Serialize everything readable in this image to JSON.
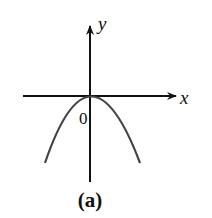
{
  "figure": {
    "caption": "(a)",
    "x_axis_label": "x",
    "y_axis_label": "y",
    "origin_label": "0",
    "curve": "downward-opening parabola with vertex at origin",
    "colors": {
      "axes": "#111111",
      "curve": "#444444",
      "background": "#ffffff"
    }
  }
}
